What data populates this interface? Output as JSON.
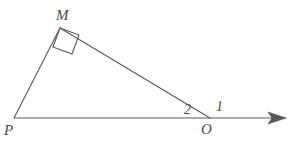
{
  "figure": {
    "type": "geometry-diagram",
    "background_color": "#ffffff",
    "stroke_color": "#585858",
    "label_color": "#4a4a4a",
    "stroke_width": 1.1,
    "width": 295,
    "height": 144
  },
  "points": {
    "M": {
      "label": "M",
      "x": 60,
      "y": 28
    },
    "P": {
      "label": "P",
      "x": 14,
      "y": 118
    },
    "O": {
      "label": "O",
      "x": 210,
      "y": 118
    },
    "ray_end": {
      "x": 286,
      "y": 118
    }
  },
  "segments": [
    {
      "name": "segment-PM",
      "from": "P",
      "to": "M"
    },
    {
      "name": "segment-MO",
      "from": "M",
      "to": "O"
    },
    {
      "name": "ray-PO-extended",
      "from": "P",
      "to": "ray_end"
    }
  ],
  "right_angle": {
    "at": "M",
    "marker": "square",
    "size": 20,
    "points": "60,28 79,35 72,54 53,47"
  },
  "arrowhead": {
    "name": "ray-arrowhead",
    "points": "286,118 268,112 272,118 268,124",
    "direction": "right"
  },
  "angle_labels": [
    {
      "name": "angle-1",
      "label": "1",
      "at_vertex": "O",
      "position": "above-right"
    },
    {
      "name": "angle-2",
      "label": "2",
      "at_vertex": "O",
      "position": "above-left"
    }
  ]
}
